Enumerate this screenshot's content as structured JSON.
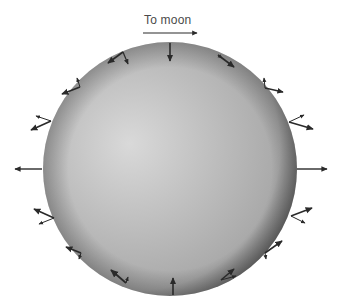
{
  "diagram": {
    "title_label": "To moon",
    "direction_arrow": {
      "x1": 143,
      "y1": 33,
      "x2": 197,
      "y2": 33
    },
    "sphere": {
      "cx": 170,
      "cy": 169,
      "r": 127,
      "highlight_color": "#d9d9d9",
      "mid_color": "#a9a9a9",
      "shadow_color": "#4a4a4a"
    },
    "arrow_color": "#2a2a2a",
    "arrows": [
      {
        "x1": 170,
        "y1": 43,
        "x2": 170,
        "y2": 61,
        "weight": 1.6
      },
      {
        "x1": 297,
        "y1": 169,
        "x2": 327,
        "y2": 169,
        "weight": 1.4
      },
      {
        "x1": 42,
        "y1": 169,
        "x2": 15,
        "y2": 169,
        "weight": 1.4
      },
      {
        "x1": 173,
        "y1": 295,
        "x2": 173,
        "y2": 278,
        "weight": 1.6
      },
      {
        "x1": 123,
        "y1": 52,
        "x2": 108,
        "y2": 63,
        "weight": 1.6
      },
      {
        "x1": 123,
        "y1": 52,
        "x2": 128,
        "y2": 64,
        "weight": 1.2
      },
      {
        "x1": 218,
        "y1": 55,
        "x2": 234,
        "y2": 67,
        "weight": 1.6
      },
      {
        "x1": 218,
        "y1": 55,
        "x2": 222,
        "y2": 58,
        "weight": 1.0
      },
      {
        "x1": 265,
        "y1": 88,
        "x2": 283,
        "y2": 92,
        "weight": 1.4
      },
      {
        "x1": 265,
        "y1": 88,
        "x2": 264,
        "y2": 78,
        "weight": 1.0
      },
      {
        "x1": 289,
        "y1": 122,
        "x2": 313,
        "y2": 129,
        "weight": 1.6
      },
      {
        "x1": 289,
        "y1": 122,
        "x2": 304,
        "y2": 115,
        "weight": 1.0
      },
      {
        "x1": 80,
        "y1": 87,
        "x2": 62,
        "y2": 94,
        "weight": 1.6
      },
      {
        "x1": 80,
        "y1": 87,
        "x2": 77,
        "y2": 78,
        "weight": 1.0
      },
      {
        "x1": 51,
        "y1": 121,
        "x2": 31,
        "y2": 130,
        "weight": 1.6
      },
      {
        "x1": 51,
        "y1": 121,
        "x2": 36,
        "y2": 116,
        "weight": 1.0
      },
      {
        "x1": 54,
        "y1": 218,
        "x2": 34,
        "y2": 209,
        "weight": 1.6
      },
      {
        "x1": 54,
        "y1": 218,
        "x2": 39,
        "y2": 224,
        "weight": 1.0
      },
      {
        "x1": 81,
        "y1": 253,
        "x2": 66,
        "y2": 247,
        "weight": 1.6
      },
      {
        "x1": 81,
        "y1": 253,
        "x2": 79,
        "y2": 259,
        "weight": 1.0
      },
      {
        "x1": 126,
        "y1": 283,
        "x2": 111,
        "y2": 270,
        "weight": 1.8
      },
      {
        "x1": 126,
        "y1": 283,
        "x2": 128,
        "y2": 277,
        "weight": 1.0
      },
      {
        "x1": 221,
        "y1": 280,
        "x2": 234,
        "y2": 269,
        "weight": 1.6
      },
      {
        "x1": 221,
        "y1": 280,
        "x2": 236,
        "y2": 276,
        "weight": 1.0
      },
      {
        "x1": 265,
        "y1": 253,
        "x2": 282,
        "y2": 241,
        "weight": 1.6
      },
      {
        "x1": 265,
        "y1": 253,
        "x2": 266,
        "y2": 259,
        "weight": 1.0
      },
      {
        "x1": 291,
        "y1": 216,
        "x2": 312,
        "y2": 208,
        "weight": 1.6
      },
      {
        "x1": 291,
        "y1": 216,
        "x2": 305,
        "y2": 223,
        "weight": 1.0
      }
    ]
  }
}
